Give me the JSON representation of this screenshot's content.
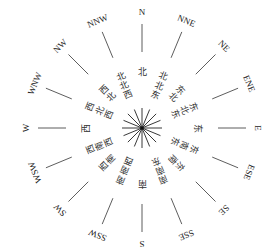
{
  "diagram": {
    "type": "wind-rose",
    "center": [
      142,
      128
    ],
    "colors": {
      "line": "#222222",
      "text": "#222222",
      "background": "#ffffff"
    },
    "directions": [
      {
        "en": "N",
        "cn": "北",
        "angle": 0
      },
      {
        "en": "NNE",
        "cn": "北北东",
        "angle": 22.5
      },
      {
        "en": "NE",
        "cn": "东北",
        "angle": 45
      },
      {
        "en": "ENE",
        "cn": "东北东",
        "angle": 67.5
      },
      {
        "en": "E",
        "cn": "东",
        "angle": 90
      },
      {
        "en": "ESE",
        "cn": "东南东",
        "angle": 112.5
      },
      {
        "en": "SE",
        "cn": "东南",
        "angle": 135
      },
      {
        "en": "SSE",
        "cn": "南南东",
        "angle": 157.5
      },
      {
        "en": "S",
        "cn": "南",
        "angle": 180
      },
      {
        "en": "SSW",
        "cn": "南南西",
        "angle": 202.5
      },
      {
        "en": "SW",
        "cn": "西南",
        "angle": 225
      },
      {
        "en": "WSW",
        "cn": "西南西",
        "angle": 247.5
      },
      {
        "en": "W",
        "cn": "西",
        "angle": 270
      },
      {
        "en": "WNW",
        "cn": "西北西",
        "angle": 292.5
      },
      {
        "en": "NW",
        "cn": "西北",
        "angle": 315
      },
      {
        "en": "NNW",
        "cn": "北北西",
        "angle": 337.5
      }
    ]
  }
}
